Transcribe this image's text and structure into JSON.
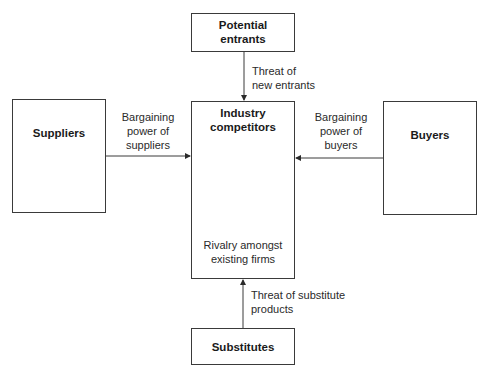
{
  "diagram": {
    "type": "Porter's five forces",
    "nodes": {
      "potential_entrants": {
        "title_line1": "Potential",
        "title_line2": "entrants"
      },
      "suppliers": {
        "title": "Suppliers"
      },
      "industry": {
        "title_line1": "Industry",
        "title_line2": "competitors",
        "caption_line1": "Rivalry amongst",
        "caption_line2": "existing firms"
      },
      "buyers": {
        "title": "Buyers"
      },
      "substitutes": {
        "title": "Substitutes"
      }
    },
    "edges": {
      "entrants_to_industry": {
        "line1": "Threat of",
        "line2": "new entrants"
      },
      "suppliers_to_industry": {
        "line1": "Bargaining",
        "line2": "power of",
        "line3": "suppliers"
      },
      "buyers_to_industry": {
        "line1": "Bargaining",
        "line2": "power of",
        "line3": "buyers"
      },
      "substitutes_to_industry": {
        "line1": "Threat of substitute",
        "line2": "products"
      }
    },
    "colors": {
      "line": "#3a3a3a",
      "text": "#1a1a1a",
      "background": "#ffffff"
    }
  }
}
